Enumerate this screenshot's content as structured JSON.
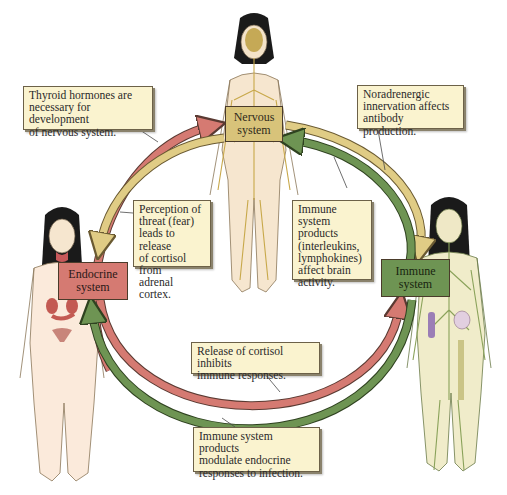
{
  "diagram": {
    "type": "cycle",
    "colors": {
      "nervous": "#d8c37a",
      "endocrine": "#d57a72",
      "immune": "#6e9453",
      "note_bg": "#faf3cf"
    },
    "systems": {
      "nervous": {
        "label": "Nervous\nsystem"
      },
      "endocrine": {
        "label": "Endocrine\nsystem"
      },
      "immune": {
        "label": "Immune\nsystem"
      }
    },
    "notes": {
      "thyroid": "Thyroid hormones are\nnecessary for development\nof nervous system.",
      "noradrenergic": "Noradrenergic\ninnervation affects\nantibody production.",
      "perception": "Perception of\nthreat (fear)\nleads to release\nof cortisol from\nadrenal cortex.",
      "immune_brain": "Immune system\nproducts\n(interleukins,\nlymphokines)\naffect brain\nactivity.",
      "cortisol_inhibits": "Release of cortisol inhibits\nimmune responses.",
      "immune_endocrine": "Immune system products\nmodulate endocrine\nresponses to infection."
    },
    "arrows": [
      {
        "from": "endocrine",
        "to": "nervous",
        "color": "endocrine",
        "note": "thyroid"
      },
      {
        "from": "nervous",
        "to": "endocrine",
        "color": "nervous",
        "note": "perception"
      },
      {
        "from": "nervous",
        "to": "immune",
        "color": "nervous",
        "note": "noradrenergic"
      },
      {
        "from": "immune",
        "to": "nervous",
        "color": "immune",
        "note": "immune_brain"
      },
      {
        "from": "endocrine",
        "to": "immune",
        "color": "endocrine",
        "note": "cortisol_inhibits"
      },
      {
        "from": "immune",
        "to": "endocrine",
        "color": "immune",
        "note": "immune_endocrine"
      }
    ],
    "figures": [
      {
        "name": "nervous-system-figure",
        "position": "top-center"
      },
      {
        "name": "endocrine-system-figure",
        "position": "left"
      },
      {
        "name": "immune-system-figure",
        "position": "right"
      }
    ]
  }
}
